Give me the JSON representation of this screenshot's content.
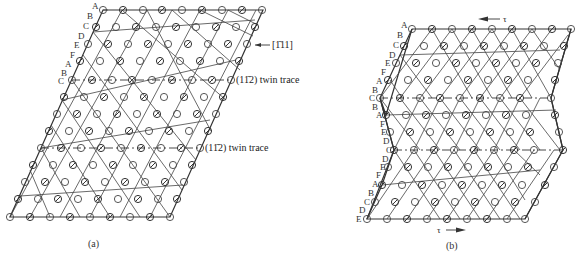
{
  "figure_a": {
    "caption": "(a)",
    "direction_label": "[Ī11]",
    "direction_label_display": "[1̄11]",
    "twin_trace_labels": [
      "(11̄2) twin trace",
      "(11̄2) twin trace"
    ],
    "stacking_labels": [
      "A",
      "B",
      "C",
      "D",
      "E",
      "F",
      "A",
      "B",
      "C"
    ]
  },
  "figure_b": {
    "caption": "(b)",
    "shear_top_label": "τ",
    "shear_bottom_label": "τ",
    "stacking_labels_upper": [
      "A",
      "B",
      "C",
      "D",
      "E",
      "F",
      "A",
      "B",
      "C",
      "B",
      "A",
      "F"
    ],
    "stacking_labels_lower": [
      "E",
      "D",
      "C",
      "D",
      "E",
      "F",
      "A",
      "B",
      "C",
      "D",
      "E"
    ]
  },
  "colors": {
    "line": "#333333",
    "atom_outline": "#333333",
    "background": "#ffffff"
  }
}
